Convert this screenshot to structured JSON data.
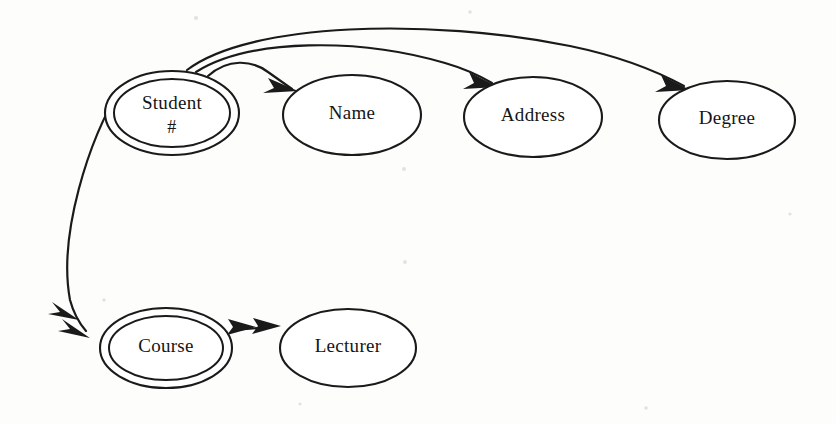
{
  "diagram": {
    "type": "entity-attribute-diagram",
    "background_color": "#fdfdfc",
    "ink_color": "#1a1a1a",
    "nodes": [
      {
        "id": "student",
        "label": "Student",
        "sublabel": "#",
        "shape": "double-ellipse",
        "role": "entity-key",
        "cx": 172,
        "cy": 113,
        "rx": 67,
        "ry": 42
      },
      {
        "id": "name",
        "label": "Name",
        "sublabel": "",
        "shape": "ellipse",
        "role": "attribute",
        "cx": 352,
        "cy": 115,
        "rx": 69,
        "ry": 40
      },
      {
        "id": "address",
        "label": "Address",
        "sublabel": "",
        "shape": "ellipse",
        "role": "attribute",
        "cx": 533,
        "cy": 117,
        "rx": 69,
        "ry": 40
      },
      {
        "id": "degree",
        "label": "Degree",
        "sublabel": "",
        "shape": "ellipse",
        "role": "attribute",
        "cx": 727,
        "cy": 120,
        "rx": 68,
        "ry": 39
      },
      {
        "id": "course",
        "label": "Course",
        "sublabel": "",
        "shape": "double-ellipse",
        "role": "entity-key",
        "cx": 166,
        "cy": 348,
        "rx": 66,
        "ry": 40
      },
      {
        "id": "lecturer",
        "label": "Lecturer",
        "sublabel": "",
        "shape": "ellipse",
        "role": "attribute",
        "cx": 348,
        "cy": 348,
        "rx": 68,
        "ry": 39
      }
    ],
    "edges": [
      {
        "id": "student-to-name",
        "from": "Student #",
        "to": "Name",
        "arrow": "single",
        "style": "curved-arc",
        "path": "M 208 76 C 228 58 252 60 268 72 C 278 79 285 84 292 89"
      },
      {
        "id": "student-to-address",
        "from": "Student #",
        "to": "Address",
        "arrow": "single",
        "style": "curved-arc",
        "path": "M 196 72 C 250 38 360 38 445 63 C 466 69 480 76 492 83"
      },
      {
        "id": "student-to-degree",
        "from": "Student #",
        "to": "Degree",
        "arrow": "single",
        "style": "curved-arc",
        "path": "M 187 70 C 250 22 430 18 570 46 C 628 58 662 74 684 86"
      },
      {
        "id": "student-to-course",
        "from": "Student #",
        "to": "Course",
        "arrow": "double",
        "style": "curved-arc",
        "path": "M 122 86 C 88 140 58 236 70 300 C 74 315 80 324 86 331"
      },
      {
        "id": "course-to-lecturer",
        "from": "Course",
        "to": "Lecturer",
        "arrow": "double",
        "style": "straight",
        "path": "M 234 330 L 272 327"
      }
    ]
  }
}
